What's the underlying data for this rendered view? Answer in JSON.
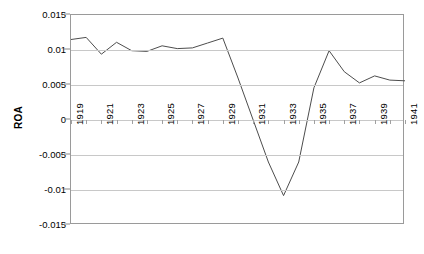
{
  "chart_data": {
    "type": "line",
    "title": "",
    "xlabel": "",
    "ylabel": "ROA",
    "ylim": [
      -0.015,
      0.015
    ],
    "xlim": [
      1919,
      1941
    ],
    "grid": true,
    "legend": "none",
    "y_ticks": [
      0.015,
      0.01,
      0.005,
      0,
      -0.005,
      -0.01,
      -0.015
    ],
    "y_tick_labels": [
      "0.015",
      "0.01",
      "0.005",
      "0",
      "-0.005",
      "-0.01",
      "-0.015"
    ],
    "x_tick_labels": [
      "1919",
      "1921",
      "1923",
      "1925",
      "1927",
      "1929",
      "1931",
      "1933",
      "1935",
      "1937",
      "1939",
      "1941"
    ],
    "x": [
      1919,
      1920,
      1921,
      1922,
      1923,
      1924,
      1925,
      1926,
      1927,
      1928,
      1929,
      1930,
      1931,
      1932,
      1933,
      1934,
      1935,
      1936,
      1937,
      1938,
      1939,
      1940,
      1941
    ],
    "values": [
      0.0115,
      0.0118,
      0.0094,
      0.0111,
      0.0099,
      0.0098,
      0.0106,
      0.0102,
      0.0103,
      0.011,
      0.0117,
      0.006,
      0.0,
      -0.006,
      -0.0108,
      -0.006,
      0.0046,
      0.0099,
      0.0069,
      0.0053,
      0.0063,
      0.0057,
      0.0056
    ],
    "series": [
      {
        "name": "ROA",
        "color": "#4d4d4d",
        "values": [
          0.0115,
          0.0118,
          0.0094,
          0.0111,
          0.0099,
          0.0098,
          0.0106,
          0.0102,
          0.0103,
          0.011,
          0.0117,
          0.006,
          0.0,
          -0.006,
          -0.0108,
          -0.006,
          0.0046,
          0.0099,
          0.0069,
          0.0053,
          0.0063,
          0.0057,
          0.0056
        ]
      }
    ]
  },
  "axis": {
    "y_title": "ROA"
  },
  "colors": {
    "line": "#4d4d4d",
    "grid": "#c8c8c8",
    "frame": "#9a9a9a",
    "background": "#ffffff",
    "text": "#000000"
  }
}
